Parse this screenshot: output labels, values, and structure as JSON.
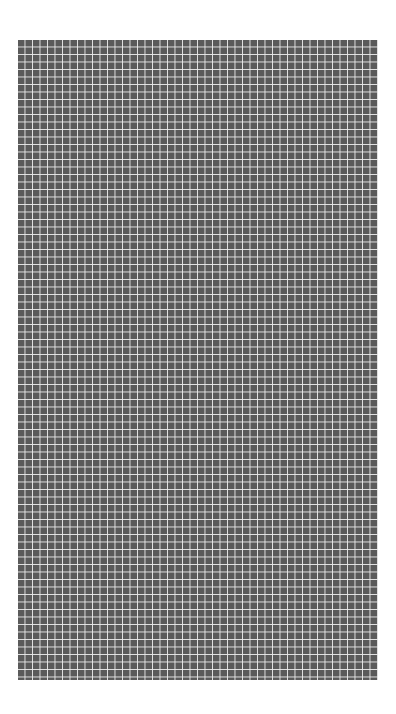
{
  "canvas": {
    "width": 360,
    "height": 640,
    "cell_pitch_px": 7.5,
    "columns": 48,
    "rows": 85,
    "cell_color": "#5a5a5a",
    "line_color": "#ebebeb",
    "background_color": "#ffffff"
  }
}
